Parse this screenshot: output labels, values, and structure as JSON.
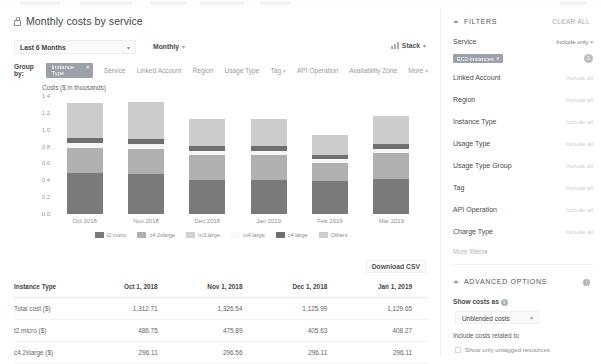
{
  "header": {
    "title": "Monthly costs by service",
    "lock_icon": "lock-icon"
  },
  "controls": {
    "date_range": "Last 6 Months",
    "granularity": "Monthly",
    "stack_label": "Stack",
    "stack_icon": "bar-chart-icon",
    "caret": "▾"
  },
  "group_by": {
    "label": "Group by:",
    "active_chip": "Instance Type",
    "chip_remove": "✕",
    "options": [
      "Service",
      "Linked Account",
      "Region",
      "Usage Type",
      "Tag",
      "API Operation",
      "Availability Zone",
      "More"
    ],
    "caret_options": [
      "Tag",
      "More"
    ]
  },
  "chart_data": {
    "type": "bar",
    "title": "Monthly costs by service",
    "ylabel": "Costs ($ in thousands)",
    "xlabel": "",
    "ylim": [
      0.0,
      1.4
    ],
    "yticks": [
      "1.4",
      "1.2",
      "1.0",
      "0.8",
      "0.6",
      "0.4",
      "0.2",
      "0.0"
    ],
    "ytick_values": [
      1.4,
      1.2,
      1.0,
      0.8,
      0.6,
      0.4,
      0.2,
      0.0
    ],
    "grid": false,
    "stacked": true,
    "legend_position": "bottom",
    "categories": [
      "Oct 2018",
      "Nov 2018",
      "Dec 2018",
      "Jan 2019",
      "Feb 2019",
      "Mar 2019"
    ],
    "series": [
      {
        "name": "t2.micro",
        "color": "#7a7a7a",
        "values": [
          0.487,
          0.476,
          0.406,
          0.408,
          0.392,
          0.42
        ]
      },
      {
        "name": "c4.2xlarge",
        "color": "#b0b0b0",
        "values": [
          0.296,
          0.297,
          0.296,
          0.296,
          0.211,
          0.299
        ]
      },
      {
        "name": "m3.large",
        "color": "#f5f5f5",
        "values": [
          0.055,
          0.057,
          0.049,
          0.045,
          0.048,
          0.054
        ]
      },
      {
        "name": "m4.large",
        "color": "#ffffff",
        "values": [
          0.0,
          0.0,
          0.0,
          0.0,
          0.0,
          0.0
        ]
      },
      {
        "name": "c4.large",
        "color": "#6f6f6f",
        "values": [
          0.068,
          0.066,
          0.056,
          0.054,
          0.053,
          0.058
        ]
      },
      {
        "name": "Others",
        "color": "#cccccc",
        "values": [
          0.407,
          0.43,
          0.319,
          0.326,
          0.236,
          0.335
        ]
      }
    ]
  },
  "legend": [
    {
      "label": "t2.micro",
      "color": "#7a7a7a"
    },
    {
      "label": "c4.2xlarge",
      "color": "#b0b0b0"
    },
    {
      "label": "m3.large",
      "color": "#d0d0d0"
    },
    {
      "label": "m4.large",
      "color": "#f7f7f7"
    },
    {
      "label": "c4.large",
      "color": "#6f6f6f"
    },
    {
      "label": "Others",
      "color": "#cccccc"
    }
  ],
  "download": {
    "label": "Download CSV"
  },
  "table": {
    "columns": [
      "Instance Type",
      "Oct 1, 2018",
      "Nov 1, 2018",
      "Dec 1, 2018",
      "Jan 1, 2019"
    ],
    "rows": [
      {
        "name": "Total cost ($)",
        "values": [
          "1,312.71",
          "1,326.54",
          "1,125.99",
          "1,129.65"
        ]
      },
      {
        "name": "t2.micro ($)",
        "values": [
          "486.75",
          "475.89",
          "405.63",
          "408.27"
        ]
      },
      {
        "name": "c4.2xlarge ($)",
        "values": [
          "296.11",
          "296.56",
          "296.11",
          "296.11"
        ]
      }
    ]
  },
  "filters": {
    "section_title": "FILTERS",
    "clear_all": "CLEAR ALL",
    "service": {
      "name": "Service",
      "value": "Include only",
      "caret": "▾"
    },
    "service_chip": {
      "label": "EC2-Instances",
      "remove": "✕",
      "count": "1"
    },
    "rows": [
      {
        "name": "Linked Account",
        "value": "Include all"
      },
      {
        "name": "Region",
        "value": "Include all"
      },
      {
        "name": "Instance Type",
        "value": "Include all"
      },
      {
        "name": "Usage Type",
        "value": "Include all"
      },
      {
        "name": "Usage Type Group",
        "value": "Include all"
      },
      {
        "name": "Tag",
        "value": "Include all"
      },
      {
        "name": "API Operation",
        "value": "Include all"
      },
      {
        "name": "Charge Type",
        "value": "Include all"
      }
    ],
    "more_filters": "More filters",
    "more_caret": "▾"
  },
  "advanced": {
    "section_title": "ADVANCED OPTIONS",
    "info_icon": "info-icon",
    "show_costs_as_label": "Show costs as",
    "show_costs_as_value": "Unblended costs",
    "caret": "▾",
    "include_costs_label": "Include costs related to",
    "untagged_checkbox_label": "Show only untagged resources"
  }
}
